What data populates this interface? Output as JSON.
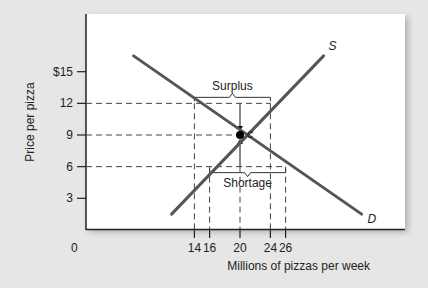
{
  "chart_data": {
    "type": "line",
    "title": "",
    "xlabel": "Millions of pizzas per week",
    "ylabel": "Price per pizza",
    "origin_label": "0",
    "x_ticks": [
      14,
      16,
      20,
      24,
      26
    ],
    "x_tick_labels": [
      "14",
      "16",
      "20",
      "24",
      "26"
    ],
    "y_ticks": [
      3,
      6,
      9,
      12,
      15
    ],
    "y_tick_labels": [
      "3",
      "6",
      "9",
      "12",
      "$15"
    ],
    "series": [
      {
        "name": "D",
        "label": "D",
        "kind": "demand",
        "points": [
          [
            6,
            16.5
          ],
          [
            36,
            1.5
          ]
        ]
      },
      {
        "name": "S",
        "label": "S",
        "kind": "supply",
        "points": [
          [
            11,
            1.5
          ],
          [
            31,
            16.5
          ]
        ]
      }
    ],
    "equilibrium": {
      "label": "c",
      "x": 20,
      "y": 9
    },
    "annotations": [
      {
        "text": "Surplus",
        "price": 12,
        "from_x": 14,
        "to_x": 24
      },
      {
        "text": "Shortage",
        "price": 6,
        "from_x": 16,
        "to_x": 26
      }
    ],
    "guides": {
      "horizontal": [
        12,
        9,
        6
      ],
      "vertical": [
        14,
        16,
        20,
        24,
        26
      ]
    },
    "grid": false,
    "legend": "none",
    "colors": {
      "curve": "#555555",
      "guide": "#444444",
      "panel": "#ffffff",
      "background": "#e6e6e6"
    }
  }
}
